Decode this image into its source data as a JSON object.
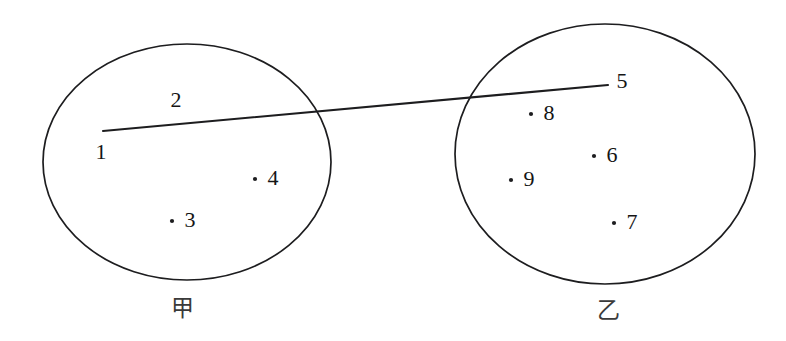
{
  "figure": {
    "width": 786,
    "height": 341,
    "background_color": "#ffffff",
    "stroke_color": "#1d1d1f",
    "text_color": "#151515",
    "caption_color": "#3a3a3a"
  },
  "sets": [
    {
      "id": "set-jia",
      "caption": "甲",
      "caption_x": 182,
      "caption_y": 308,
      "cx": 187,
      "cy": 162,
      "rx": 144,
      "ry": 118
    },
    {
      "id": "set-yi",
      "caption": "乙",
      "caption_x": 608,
      "caption_y": 310,
      "cx": 605,
      "cy": 154,
      "rx": 150,
      "ry": 130
    }
  ],
  "nodes": [
    {
      "label": "1",
      "set": "set-jia",
      "label_x": 101,
      "label_y": 152,
      "dot": false,
      "dot_x": 0,
      "dot_y": 0
    },
    {
      "label": "2",
      "set": "set-jia",
      "label_x": 176,
      "label_y": 100,
      "dot": false,
      "dot_x": 0,
      "dot_y": 0
    },
    {
      "label": "3",
      "set": "set-jia",
      "label_x": 190,
      "label_y": 220,
      "dot": true,
      "dot_x": 172,
      "dot_y": 221
    },
    {
      "label": "4",
      "set": "set-jia",
      "label_x": 273,
      "label_y": 178,
      "dot": true,
      "dot_x": 255,
      "dot_y": 179
    },
    {
      "label": "5",
      "set": "set-yi",
      "label_x": 622,
      "label_y": 81,
      "dot": false,
      "dot_x": 0,
      "dot_y": 0
    },
    {
      "label": "6",
      "set": "set-yi",
      "label_x": 612,
      "label_y": 155,
      "dot": true,
      "dot_x": 594,
      "dot_y": 156
    },
    {
      "label": "7",
      "set": "set-yi",
      "label_x": 632,
      "label_y": 222,
      "dot": true,
      "dot_x": 614,
      "dot_y": 223
    },
    {
      "label": "8",
      "set": "set-yi",
      "label_x": 549,
      "label_y": 113,
      "dot": true,
      "dot_x": 531,
      "dot_y": 114
    },
    {
      "label": "9",
      "set": "set-yi",
      "label_x": 529,
      "label_y": 179,
      "dot": true,
      "dot_x": 511,
      "dot_y": 180
    }
  ],
  "connector": {
    "from_label": "1",
    "to_label": "5",
    "x1": 103,
    "y1": 131,
    "x2": 608,
    "y2": 85
  }
}
